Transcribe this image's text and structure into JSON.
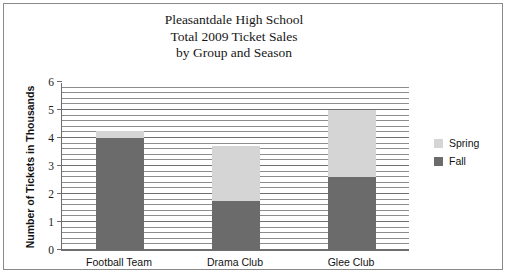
{
  "chart_data": {
    "type": "bar",
    "stacked": true,
    "title": "Pleasantdale High School Total 2009 Ticket Sales by Group and Season",
    "title_lines": [
      "Pleasantdale High School",
      "Total 2009 Ticket Sales",
      "by Group and Season"
    ],
    "categories": [
      "Football Team",
      "Drama Club",
      "Glee Club"
    ],
    "series": [
      {
        "name": "Fall",
        "color": "#6b6b6b",
        "values": [
          4.0,
          1.75,
          2.6
        ]
      },
      {
        "name": "Spring",
        "color": "#d5d5d5",
        "values": [
          0.25,
          1.95,
          2.4
        ]
      }
    ],
    "totals": [
      4.25,
      3.7,
      5.0
    ],
    "xlabel": "",
    "ylabel": "Number of Tickets in Thousands",
    "ylim": [
      0,
      6
    ],
    "ytick_values": [
      0,
      1,
      2,
      3,
      4,
      5,
      6
    ],
    "ytick_labels": [
      "0",
      "1",
      "2",
      "3",
      "4",
      "5",
      "6"
    ],
    "minor_gridline_step": 0.2,
    "grid": true,
    "legend_position": "right",
    "legend_entries": [
      {
        "label": "Spring",
        "color": "#d5d5d5"
      },
      {
        "label": "Fall",
        "color": "#6b6b6b"
      }
    ]
  }
}
